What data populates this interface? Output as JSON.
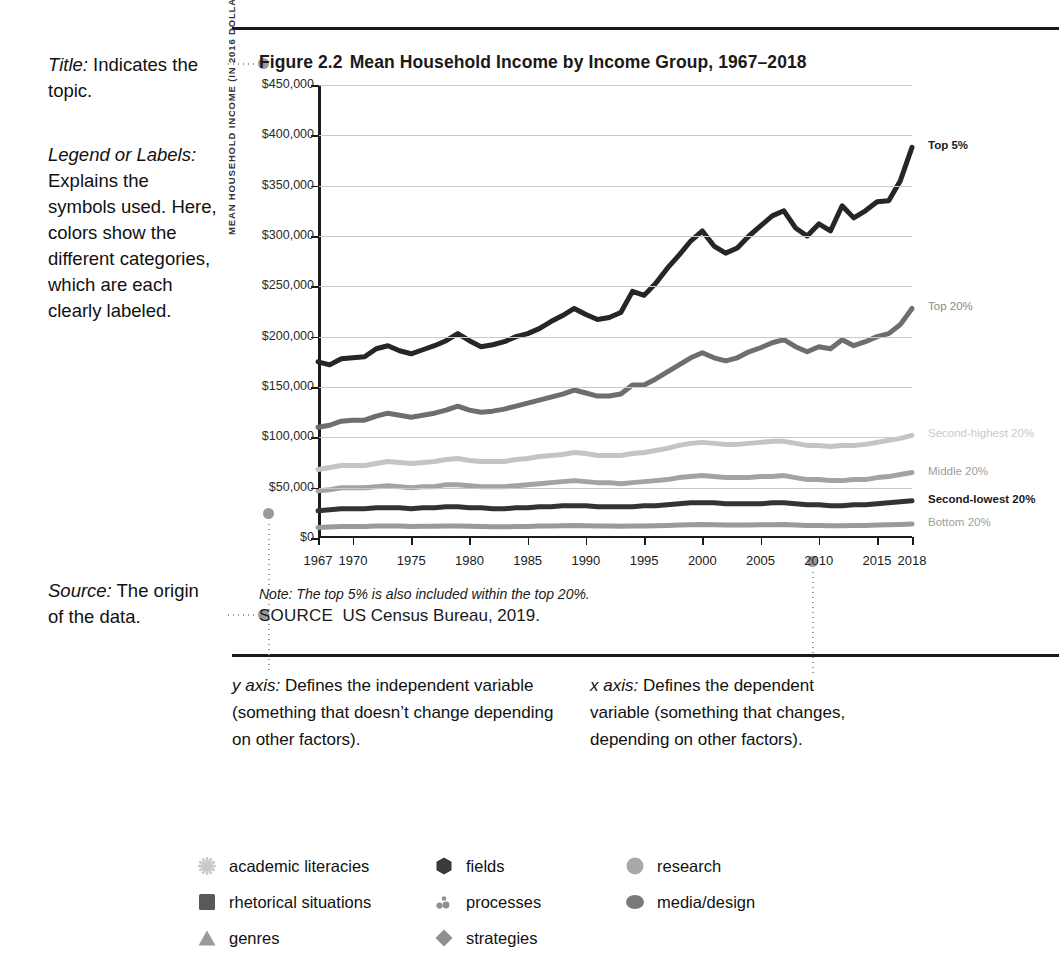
{
  "gloss": {
    "title": {
      "term": "Title:",
      "text": " Indicates the topic."
    },
    "legend": {
      "term": "Legend or Labels:",
      "text": " Explains the symbols used. Here, colors show the different categories, which are each clearly labeled."
    },
    "source": {
      "term": "Source:",
      "text": " The origin of the data."
    }
  },
  "figure": {
    "number": "Figure 2.2",
    "title": "Mean Household Income by Income Group, 1967–2018",
    "note": "Note: The top 5% is also included within the top 20%.",
    "source_keyword": "SOURCE",
    "source_text": "US Census Bureau, 2019."
  },
  "axis_notes": {
    "y": {
      "label": "y axis:",
      "text": " Defines the independent variable (something that doesn’t change depending on other factors)."
    },
    "x": {
      "label": "x axis:",
      "text": " Defines the dependent variable (something that changes, depending on other factors)."
    }
  },
  "footer": {
    "columns": [
      [
        {
          "icon": "asterisk-icon",
          "label": "academic literacies",
          "color": "#c9c9c9"
        },
        {
          "icon": "square-icon",
          "label": "rhetorical situations",
          "color": "#595959"
        },
        {
          "icon": "triangle-icon",
          "label": "genres",
          "color": "#9a9a9a"
        }
      ],
      [
        {
          "icon": "hexagon-icon",
          "label": "fields",
          "color": "#3a3a3a"
        },
        {
          "icon": "dots-icon",
          "label": "processes",
          "color": "#8f8f8f"
        },
        {
          "icon": "diamond-icon",
          "label": "strategies",
          "color": "#8f8f8f"
        }
      ],
      [
        {
          "icon": "circle-icon",
          "label": "research",
          "color": "#a8a8a8"
        },
        {
          "icon": "ellipse-icon",
          "label": "media/design",
          "color": "#7a7a7a"
        }
      ]
    ]
  },
  "chart_data": {
    "type": "line",
    "xlabel": "",
    "ylabel": "MEAN HOUSEHOLD INCOME (IN 2016 DOLLARS)",
    "ylim": [
      0,
      450000
    ],
    "xlim": [
      1967,
      2018
    ],
    "ytick_labels": [
      "$450,000",
      "$400,000",
      "$350,000",
      "$300,000",
      "$250,000",
      "$200,000",
      "$150,000",
      "$100,000",
      "$50,000",
      "$0"
    ],
    "ytick_values": [
      450000,
      400000,
      350000,
      300000,
      250000,
      200000,
      150000,
      100000,
      50000,
      0
    ],
    "xtick_labels": [
      "1967",
      "1970",
      "1975",
      "1980",
      "1985",
      "1990",
      "1995",
      "2000",
      "2005",
      "2010",
      "2015",
      "2018"
    ],
    "xtick_values": [
      1967,
      1970,
      1975,
      1980,
      1985,
      1990,
      1995,
      2000,
      2005,
      2010,
      2015,
      2018
    ],
    "grid": "horizontal",
    "legend_position": "right-inline",
    "x": [
      1967,
      1968,
      1969,
      1970,
      1971,
      1972,
      1973,
      1974,
      1975,
      1976,
      1977,
      1978,
      1979,
      1980,
      1981,
      1982,
      1983,
      1984,
      1985,
      1986,
      1987,
      1988,
      1989,
      1990,
      1991,
      1992,
      1993,
      1994,
      1995,
      1996,
      1997,
      1998,
      1999,
      2000,
      2001,
      2002,
      2003,
      2004,
      2005,
      2006,
      2007,
      2008,
      2009,
      2010,
      2011,
      2012,
      2013,
      2014,
      2015,
      2016,
      2017,
      2018
    ],
    "series": [
      {
        "name": "Top 5%",
        "color": "#262626",
        "label_color": "#1a1a1a",
        "label_weight": "bold",
        "values": [
          175000,
          172000,
          178000,
          179000,
          180000,
          188000,
          191000,
          186000,
          183000,
          187000,
          191000,
          196000,
          203000,
          196000,
          190000,
          192000,
          195000,
          200000,
          203000,
          208000,
          215000,
          221000,
          228000,
          222000,
          217000,
          219000,
          224000,
          245000,
          241000,
          253000,
          268000,
          281000,
          295000,
          305000,
          290000,
          283000,
          288000,
          300000,
          310000,
          320000,
          325000,
          308000,
          300000,
          312000,
          305000,
          330000,
          318000,
          325000,
          334000,
          335000,
          355000,
          388000
        ]
      },
      {
        "name": "Top 20%",
        "color": "#6e6e6e",
        "label_color": "#8a8a8a",
        "label_weight": "normal",
        "values": [
          110000,
          112000,
          116000,
          117000,
          117000,
          121000,
          124000,
          122000,
          120000,
          122000,
          124000,
          127000,
          131000,
          127000,
          125000,
          126000,
          128000,
          131000,
          134000,
          137000,
          140000,
          143000,
          147000,
          144000,
          141000,
          141000,
          143000,
          152000,
          152000,
          158000,
          165000,
          172000,
          179000,
          184000,
          179000,
          176000,
          179000,
          185000,
          189000,
          194000,
          197000,
          190000,
          185000,
          190000,
          188000,
          197000,
          191000,
          195000,
          200000,
          203000,
          212000,
          228000
        ]
      },
      {
        "name": "Second-highest 20%",
        "color": "#c4c4c4",
        "label_color": "#c9c9c9",
        "label_weight": "normal",
        "values": [
          68000,
          70000,
          72000,
          72000,
          72000,
          74000,
          76000,
          75000,
          74000,
          75000,
          76000,
          78000,
          79000,
          77000,
          76000,
          76000,
          76000,
          78000,
          79000,
          81000,
          82000,
          83000,
          85000,
          84000,
          82000,
          82000,
          82000,
          84000,
          85000,
          87000,
          89000,
          92000,
          94000,
          95000,
          94000,
          93000,
          93000,
          94000,
          95000,
          96000,
          96000,
          94000,
          92000,
          92000,
          91000,
          92000,
          92000,
          93000,
          95000,
          97000,
          99000,
          102000
        ]
      },
      {
        "name": "Middle 20%",
        "color": "#a3a3a3",
        "label_color": "#9e9e9e",
        "label_weight": "normal",
        "values": [
          47000,
          48000,
          50000,
          50000,
          50000,
          51000,
          52000,
          51000,
          50000,
          51000,
          51000,
          53000,
          53000,
          52000,
          51000,
          51000,
          51000,
          52000,
          53000,
          54000,
          55000,
          56000,
          57000,
          56000,
          55000,
          55000,
          54000,
          55000,
          56000,
          57000,
          58000,
          60000,
          61000,
          62000,
          61000,
          60000,
          60000,
          60000,
          61000,
          61000,
          62000,
          60000,
          58000,
          58000,
          57000,
          57000,
          58000,
          58000,
          60000,
          61000,
          63000,
          65000
        ]
      },
      {
        "name": "Second-lowest 20%",
        "color": "#333333",
        "label_color": "#1a1a1a",
        "label_weight": "bold",
        "values": [
          27000,
          28000,
          29000,
          29000,
          29000,
          30000,
          30000,
          30000,
          29000,
          30000,
          30000,
          31000,
          31000,
          30000,
          30000,
          29000,
          29000,
          30000,
          30000,
          31000,
          31000,
          32000,
          32000,
          32000,
          31000,
          31000,
          31000,
          31000,
          32000,
          32000,
          33000,
          34000,
          35000,
          35000,
          35000,
          34000,
          34000,
          34000,
          34000,
          35000,
          35000,
          34000,
          33000,
          33000,
          32000,
          32000,
          33000,
          33000,
          34000,
          35000,
          36000,
          37000
        ]
      },
      {
        "name": "Bottom 20%",
        "color": "#9a9a9a",
        "label_color": "#9e9e9e",
        "label_weight": "normal",
        "values": [
          10500,
          11000,
          11500,
          11500,
          11500,
          11800,
          12000,
          11800,
          11500,
          11700,
          11700,
          12000,
          12000,
          11700,
          11400,
          11200,
          11200,
          11400,
          11500,
          11800,
          12000,
          12200,
          12400,
          12200,
          11900,
          11800,
          11700,
          11800,
          12000,
          12200,
          12500,
          12800,
          13100,
          13300,
          13200,
          13000,
          13000,
          13000,
          13100,
          13200,
          13300,
          12900,
          12500,
          12400,
          12200,
          12200,
          12400,
          12500,
          12900,
          13200,
          13500,
          13800
        ]
      }
    ]
  }
}
